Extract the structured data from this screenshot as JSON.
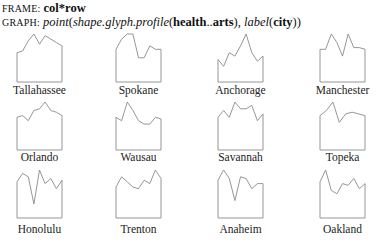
{
  "header": {
    "frame_key": "FRAME:",
    "frame_value": "col*row",
    "graph_key": "GRAPH:",
    "graph_point": "point",
    "graph_open1": "(",
    "graph_shape": "shape.glyph.profile",
    "graph_open2": "(",
    "graph_var_from": "health",
    "graph_range": "..",
    "graph_var_to": "arts",
    "graph_close2": "),",
    "graph_label": "label",
    "graph_open3": "(",
    "graph_label_var": "city",
    "graph_close3": "))"
  },
  "chart_data": {
    "type": "profile-glyph-grid",
    "variables_range": "health..arts",
    "layout": {
      "columns": 4,
      "rows": 3
    },
    "cities": [
      {
        "city": "Tallahassee",
        "profile": [
          0.45,
          0.5,
          0.8,
          1.0,
          0.7,
          0.95,
          0.85,
          0.75,
          0.65
        ]
      },
      {
        "city": "Spokane",
        "profile": [
          0.55,
          0.85,
          1.0,
          1.0,
          0.3,
          0.3,
          0.65,
          0.55,
          0.55
        ]
      },
      {
        "city": "Anchorage",
        "profile": [
          0.25,
          0.05,
          0.45,
          0.35,
          0.65,
          1.0,
          0.45,
          0.2,
          0.35
        ]
      },
      {
        "city": "Manchester",
        "profile": [
          0.55,
          0.55,
          1.0,
          0.75,
          0.35,
          1.0,
          0.6,
          0.6,
          0.55
        ]
      },
      {
        "city": "Orlando",
        "profile": [
          0.55,
          0.6,
          0.45,
          0.75,
          0.8,
          1.0,
          0.75,
          0.7,
          0.6
        ]
      },
      {
        "city": "Wausau",
        "profile": [
          0.55,
          0.45,
          1.0,
          0.75,
          0.45,
          0.35,
          0.35,
          0.55,
          0.5
        ]
      },
      {
        "city": "Savannah",
        "profile": [
          0.55,
          0.75,
          0.55,
          1.0,
          0.8,
          0.8,
          0.9,
          0.45,
          0.65
        ]
      },
      {
        "city": "Topeka",
        "profile": [
          0.6,
          0.75,
          1.0,
          0.4,
          0.65,
          0.7,
          0.65,
          0.6
        ]
      },
      {
        "city": "Honolulu",
        "profile": [
          0.65,
          0.9,
          0.8,
          0.0,
          1.0,
          0.6,
          0.75,
          0.45,
          0.7
        ]
      },
      {
        "city": "Trenton",
        "profile": [
          0.5,
          0.8,
          0.65,
          0.5,
          0.45,
          0.7,
          0.6,
          1.0,
          0.75
        ]
      },
      {
        "city": "Anaheim",
        "profile": [
          0.7,
          1.0,
          0.75,
          0.1,
          0.8,
          0.75,
          0.45,
          0.6,
          0.6
        ]
      },
      {
        "city": "Oakland",
        "profile": [
          0.65,
          1.0,
          0.4,
          0.3,
          0.6,
          0.55,
          0.75,
          0.45,
          0.6
        ]
      }
    ],
    "grid": false,
    "legend": "none"
  }
}
